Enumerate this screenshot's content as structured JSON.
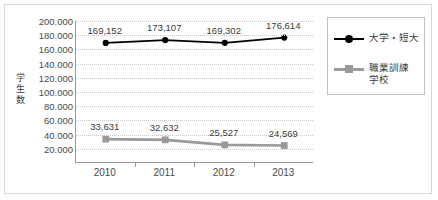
{
  "chart": {
    "y_axis_title": "学生数"
  },
  "legend": {
    "items": [
      {
        "label": "大学・短大",
        "marker": "circle-marker-icon",
        "color": "#000000"
      },
      {
        "label": "職業訓練\n学校",
        "marker": "square-marker-icon",
        "color": "#9a9a9a"
      }
    ]
  },
  "chart_data": {
    "type": "line",
    "title": "",
    "xlabel": "",
    "ylabel": "学生数",
    "categories": [
      "2010",
      "2011",
      "2012",
      "2013"
    ],
    "ylim": [
      0,
      200000
    ],
    "yticks": [
      200000,
      180000,
      160000,
      140000,
      120000,
      100000,
      80000,
      60000,
      40000,
      20000
    ],
    "ytick_labels": [
      "200.000",
      "180.000",
      "160.000",
      "140.000",
      "120.000",
      "100.000",
      "80.000",
      "60.000",
      "40.000",
      "20.000"
    ],
    "grid": true,
    "legend_position": "right",
    "series": [
      {
        "name": "大学・短大",
        "color": "#000000",
        "marker": "circle",
        "values": [
          169152,
          173107,
          169302,
          176614
        ],
        "value_labels": [
          "169,152",
          "173,107",
          "169,302",
          "176,614"
        ]
      },
      {
        "name": "職業訓練学校",
        "color": "#9a9a9a",
        "marker": "square",
        "values": [
          33631,
          32632,
          25527,
          24569
        ],
        "value_labels": [
          "33,631",
          "32,632",
          "25,527",
          "24,569"
        ]
      }
    ]
  }
}
